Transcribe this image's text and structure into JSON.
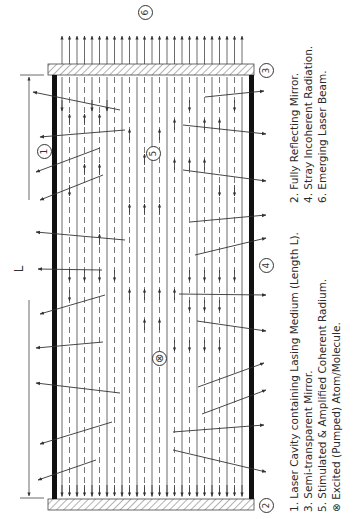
{
  "diagram": {
    "orientation": "rotated -90deg",
    "length_label": "L",
    "callouts": {
      "c1": "1",
      "c2": "2",
      "c3": "3",
      "c4": "4",
      "c5": "5",
      "c6": "6",
      "excited": "x"
    },
    "legend": {
      "left_column": [
        "1.  Laser Cavity containing Lasing Medium (Length L).",
        "3.  Semi-transparent Mirror.",
        "5.  Stimulated & Amplified Coherent Radium.",
        "Excited (Pumped) Atom/Molecule."
      ],
      "right_column": [
        "2.  Fully Reflecting Mirror.",
        "4.  Stray Incoherent Radiation.",
        "6.  Emerging Laser Beam."
      ]
    },
    "colors": {
      "line": "#333333",
      "wall": "#111111",
      "mirror_hatch": "#555555"
    }
  }
}
